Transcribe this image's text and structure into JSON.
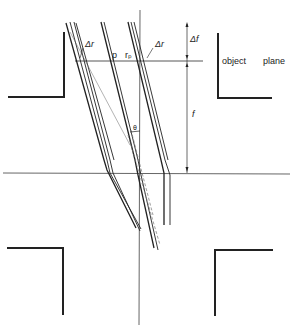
{
  "diagram": {
    "labels": {
      "delta_r_left": "Δr",
      "delta_r_right": "Δr",
      "p": "p",
      "r_p": "rₚ",
      "delta_f": "Δf",
      "f": "f",
      "theta": "θ",
      "object": "object",
      "plane": "plane"
    },
    "colors": {
      "line": "#222222",
      "thin": "#555555",
      "dashed": "#777777",
      "background": "#ffffff"
    }
  }
}
